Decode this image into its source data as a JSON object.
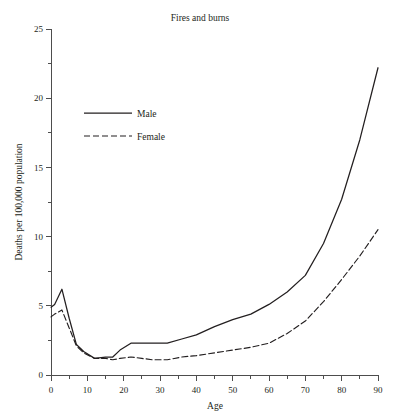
{
  "chart_data": {
    "type": "line",
    "title": "Fires and burns",
    "xlabel": "Age",
    "ylabel": "Deaths per 100,000 population",
    "xlim": [
      0,
      90
    ],
    "ylim": [
      0,
      25
    ],
    "grid": false,
    "legend_position": "upper-left",
    "x_ticks_major": [
      0,
      10,
      20,
      30,
      40,
      50,
      60,
      70,
      80,
      90
    ],
    "x_ticks_minor": [
      5,
      15,
      25,
      35,
      45,
      55,
      65,
      75,
      85
    ],
    "y_ticks_major": [
      0,
      5,
      10,
      15,
      20,
      25
    ],
    "y_ticks_minor": [
      2.5,
      7.5,
      12.5,
      17.5,
      22.5
    ],
    "x": [
      0,
      1,
      3,
      5,
      7,
      9,
      12,
      15,
      17,
      19,
      22,
      25,
      28,
      32,
      36,
      40,
      45,
      50,
      55,
      60,
      65,
      70,
      75,
      80,
      85,
      90
    ],
    "series": [
      {
        "name": "Male",
        "style": "solid",
        "values": [
          4.9,
          5.1,
          6.2,
          4.1,
          2.2,
          1.7,
          1.2,
          1.3,
          1.3,
          1.8,
          2.3,
          2.3,
          2.3,
          2.3,
          2.6,
          2.9,
          3.5,
          4.0,
          4.4,
          5.1,
          6.0,
          7.2,
          9.5,
          12.7,
          17.0,
          22.2
        ]
      },
      {
        "name": "Female",
        "style": "dashed",
        "values": [
          4.2,
          4.4,
          4.7,
          3.4,
          2.1,
          1.6,
          1.2,
          1.2,
          1.1,
          1.2,
          1.3,
          1.2,
          1.1,
          1.1,
          1.3,
          1.4,
          1.6,
          1.8,
          2.0,
          2.3,
          3.0,
          3.9,
          5.3,
          6.9,
          8.6,
          10.5
        ]
      }
    ]
  },
  "legend": {
    "items": [
      {
        "label": "Male"
      },
      {
        "label": "Female"
      }
    ]
  },
  "y_tick_labels": [
    "0",
    "5",
    "10",
    "15",
    "20",
    "25"
  ],
  "x_tick_labels": [
    "0",
    "10",
    "20",
    "30",
    "40",
    "50",
    "60",
    "70",
    "80",
    "90"
  ],
  "colors": {
    "line": "#231f20",
    "axis": "#4d4d4d",
    "background": "#ffffff"
  }
}
